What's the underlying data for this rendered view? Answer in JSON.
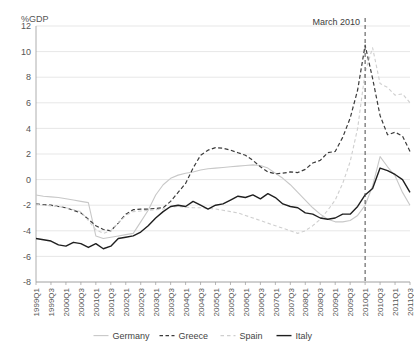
{
  "chart_data": {
    "type": "line",
    "title": "",
    "subtitle": "",
    "xlabel": "",
    "ylabel": "%GDP",
    "ylim": [
      -8,
      12
    ],
    "ytick_values": [
      -8,
      -6,
      -4,
      -2,
      0,
      2,
      4,
      6,
      8,
      10,
      12
    ],
    "ytick_labels": [
      "-8",
      "-6",
      "-4",
      "-2",
      "0",
      "2",
      "4",
      "6",
      "8",
      "10",
      "12"
    ],
    "grid": true,
    "grid_axis": "y",
    "legend_position": "bottom",
    "x": [
      "1999Q1",
      "1999Q2",
      "1999Q3",
      "1999Q4",
      "2000Q1",
      "2000Q2",
      "2000Q3",
      "2000Q4",
      "2001Q1",
      "2001Q2",
      "2001Q3",
      "2001Q4",
      "2002Q1",
      "2002Q2",
      "2002Q3",
      "2002Q4",
      "2003Q1",
      "2003Q2",
      "2003Q3",
      "2003Q4",
      "2004Q1",
      "2004Q2",
      "2004Q3",
      "2004Q4",
      "2005Q1",
      "2005Q2",
      "2005Q3",
      "2005Q4",
      "2006Q1",
      "2006Q2",
      "2006Q3",
      "2006Q4",
      "2007Q1",
      "2007Q2",
      "2007Q3",
      "2007Q4",
      "2008Q1",
      "2008Q2",
      "2008Q3",
      "2008Q4",
      "2009Q1",
      "2009Q2",
      "2009Q3",
      "2009Q4",
      "2010Q1",
      "2010Q2",
      "2010Q3",
      "2010Q4",
      "2011Q1",
      "2011Q2",
      "2011Q3"
    ],
    "xtick_labels": [
      "1999Q1",
      "1999Q3",
      "2000Q1",
      "2000Q3",
      "2001Q1",
      "2001Q3",
      "2002Q1",
      "2002Q3",
      "2003Q1",
      "2003Q3",
      "2004Q1",
      "2004Q3",
      "2005Q1",
      "2005Q3",
      "2006Q1",
      "2006Q3",
      "2007Q1",
      "2007Q3",
      "2008Q1",
      "2008Q3",
      "2009Q1",
      "2009Q3",
      "2010Q1",
      "2010Q3",
      "2011Q1",
      "2011Q3"
    ],
    "xtick_indices": [
      0,
      2,
      4,
      6,
      8,
      10,
      12,
      14,
      16,
      18,
      20,
      22,
      24,
      26,
      28,
      30,
      32,
      34,
      36,
      38,
      40,
      42,
      44,
      46,
      48,
      50
    ],
    "series": [
      {
        "name": "Germany",
        "color": "#c8c8c8",
        "dash": "none",
        "width": 1.1,
        "values": [
          -1.2,
          -1.3,
          -1.35,
          -1.4,
          -1.5,
          -1.6,
          -1.7,
          -1.8,
          -4.4,
          -4.6,
          -4.5,
          -4.4,
          -4.3,
          -4.2,
          -3.3,
          -2.4,
          -1.2,
          -0.4,
          0.1,
          0.35,
          0.5,
          0.6,
          0.75,
          0.85,
          0.9,
          0.95,
          1.0,
          1.05,
          1.1,
          1.15,
          1.1,
          0.9,
          0.5,
          0.1,
          -0.4,
          -1.0,
          -1.6,
          -2.2,
          -2.7,
          -3.1,
          -3.3,
          -3.3,
          -3.2,
          -2.8,
          -2.0,
          -0.5,
          1.8,
          1.0,
          0.3,
          -1.0,
          -2.0
        ]
      },
      {
        "name": "Greece",
        "color": "#3b3b3b",
        "dash": "4,2.5",
        "width": 1.2,
        "values": [
          -1.9,
          -1.95,
          -2.0,
          -2.1,
          -2.2,
          -2.4,
          -2.6,
          -3.1,
          -3.6,
          -3.9,
          -4.0,
          -3.4,
          -2.7,
          -2.35,
          -2.3,
          -2.3,
          -2.25,
          -2.2,
          -1.7,
          -1.0,
          -0.3,
          0.9,
          1.9,
          2.3,
          2.5,
          2.45,
          2.3,
          2.1,
          1.9,
          1.5,
          1.0,
          0.6,
          0.45,
          0.5,
          0.6,
          0.55,
          0.8,
          1.3,
          1.5,
          2.1,
          2.2,
          3.3,
          4.8,
          7.0,
          10.5,
          7.9,
          5.0,
          3.5,
          3.7,
          3.4,
          2.2
        ]
      },
      {
        "name": "Spain",
        "color": "#cfcfcf",
        "dash": "3.5,2.5",
        "width": 1.1,
        "values": [
          -1.9,
          -2.0,
          -2.05,
          -2.1,
          -2.2,
          -2.35,
          -2.5,
          -3.2,
          -3.9,
          -4.2,
          -4.0,
          -3.4,
          -2.8,
          -2.5,
          -2.45,
          -2.4,
          -2.35,
          -2.3,
          -2.15,
          -2.1,
          -2.15,
          -2.2,
          -2.2,
          -2.25,
          -2.3,
          -2.4,
          -2.5,
          -2.6,
          -2.8,
          -3.0,
          -3.2,
          -3.4,
          -3.6,
          -3.8,
          -4.0,
          -4.2,
          -4.0,
          -3.6,
          -3.1,
          -2.4,
          -1.6,
          -0.3,
          1.4,
          4.0,
          8.4,
          10.3,
          7.5,
          7.2,
          6.6,
          6.7,
          6.0
        ]
      },
      {
        "name": "Italy",
        "color": "#1f1f1f",
        "dash": "none",
        "width": 1.4,
        "values": [
          -4.6,
          -4.7,
          -4.8,
          -5.1,
          -5.2,
          -4.9,
          -5.0,
          -5.3,
          -5.0,
          -5.4,
          -5.2,
          -4.6,
          -4.5,
          -4.4,
          -4.1,
          -3.6,
          -3.0,
          -2.5,
          -2.1,
          -2.0,
          -2.1,
          -1.7,
          -2.0,
          -2.3,
          -2.0,
          -1.9,
          -1.6,
          -1.3,
          -1.4,
          -1.2,
          -1.5,
          -1.1,
          -1.4,
          -1.9,
          -2.1,
          -2.2,
          -2.6,
          -2.7,
          -3.0,
          -3.1,
          -3.0,
          -2.7,
          -2.7,
          -2.1,
          -1.2,
          -0.7,
          0.9,
          0.7,
          0.4,
          0.0,
          -1.0
        ]
      }
    ],
    "annotations": [
      {
        "label": "March 2010",
        "x_index": 44,
        "type": "vertical-dashed-line",
        "label_position": "top-left"
      }
    ]
  },
  "legend": {
    "items": [
      {
        "label": "Germany",
        "style": "solid-light"
      },
      {
        "label": "Greece",
        "style": "dashed-dark"
      },
      {
        "label": "Spain",
        "style": "dashed-light"
      },
      {
        "label": "Italy",
        "style": "solid-dark"
      }
    ]
  }
}
